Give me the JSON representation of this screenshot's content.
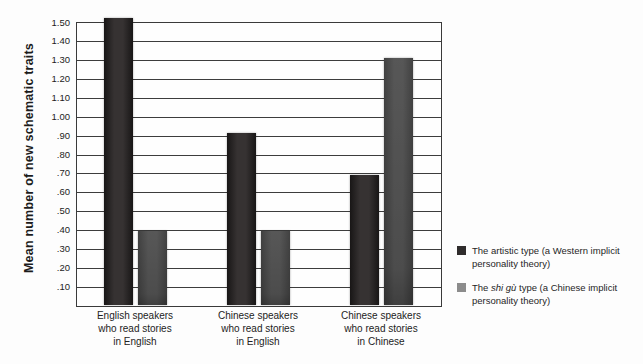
{
  "chart_data": {
    "type": "bar",
    "title": "",
    "xlabel": "",
    "ylabel": "Mean number of new schematic traits",
    "categories": [
      "English speakers\nwho read stories\nin English",
      "Chinese speakers\nwho read stories\nin English",
      "Chinese speakers\nwho read stories\nin Chinese"
    ],
    "series": [
      {
        "name": "The artistic type (a Western implicit personality theory)",
        "color": "#2f2c2c",
        "values": [
          1.52,
          0.91,
          0.69
        ]
      },
      {
        "name": "The shi gù type (a Chinese implicit personality theory)",
        "color": "#8c8c8c",
        "values": [
          0.39,
          0.39,
          1.31
        ]
      }
    ],
    "ylim": [
      0,
      1.5
    ],
    "yticks": {
      "values": [
        0.1,
        0.2,
        0.3,
        0.4,
        0.5,
        0.6,
        0.7,
        0.8,
        0.9,
        1.0,
        1.1,
        1.2,
        1.3,
        1.4,
        1.5
      ],
      "labels": [
        ".10",
        ".20",
        ".30",
        ".40",
        ".50",
        ".60",
        ".70",
        ".80",
        ".90",
        "1.00",
        "1.10",
        "1.20",
        "1.30",
        "1.40",
        "1.50"
      ]
    },
    "grid": true,
    "legend_position": "right"
  },
  "legend": {
    "items": [
      {
        "before": "The artistic type (a Western implicit\npersonality theory)",
        "italic": "",
        "after": ""
      },
      {
        "before": "The ",
        "italic": "shi gù",
        "after": " type (a Chinese implicit\npersonality theory)"
      }
    ]
  }
}
